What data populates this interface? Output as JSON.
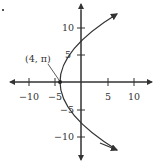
{
  "figure": {
    "type": "parabola-graph",
    "equation_hint": "x = y^2/16 - 4",
    "vertex_label": "(4, π)",
    "x_ticks": [
      {
        "value": -10,
        "label": "−10"
      },
      {
        "value": -5,
        "label": "−5"
      },
      {
        "value": 5,
        "label": "5"
      },
      {
        "value": 10,
        "label": "10"
      }
    ],
    "y_ticks": [
      {
        "value": 10,
        "label": "10"
      },
      {
        "value": 5,
        "label": "5"
      },
      {
        "value": -5,
        "label": "−5"
      },
      {
        "value": -10,
        "label": "−10"
      }
    ],
    "colors": {
      "axis": "#333333",
      "curve": "#333333"
    }
  }
}
